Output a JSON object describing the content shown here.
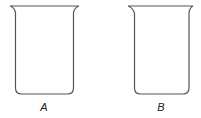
{
  "diagram": {
    "title": "",
    "stroke_color": "#555555",
    "beakers": [
      {
        "id": "A",
        "label": "A"
      },
      {
        "id": "B",
        "label": "B"
      }
    ]
  }
}
